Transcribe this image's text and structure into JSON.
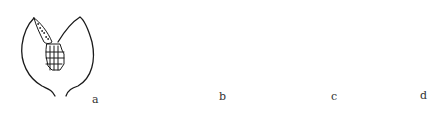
{
  "figure": {
    "panels": [
      {
        "id": "a",
        "label": "a",
        "description": "two-valved capsule opened, showing spore mass with stippled sac"
      },
      {
        "id": "b",
        "label": "b",
        "description": "rounded capsule with radiating ribbed disc at top"
      },
      {
        "id": "c",
        "label": "c",
        "description": "rounded capsule with vertical stack of segments"
      },
      {
        "id": "d",
        "label": "d",
        "description": "elongated oval capsule on stalk with transverse-ribbed band"
      }
    ],
    "colors": {
      "line": "#1a1a1a",
      "background": "#ffffff"
    }
  }
}
